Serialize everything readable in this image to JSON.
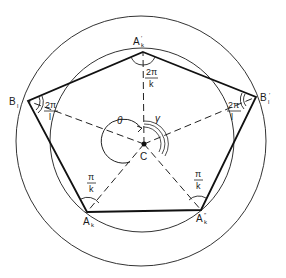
{
  "figure": {
    "circles": {
      "outer": {
        "cx": 141,
        "cy": 141,
        "r": 125
      },
      "inner": {
        "cx": 142,
        "cy": 140,
        "r": 92
      }
    },
    "center": {
      "label": "C",
      "x": 144,
      "y": 144
    },
    "vertices": [
      {
        "id": "A_k_prime",
        "label": "A",
        "sub": "k",
        "prime": "′",
        "x": 143,
        "y": 52
      },
      {
        "id": "B_l_prime",
        "label": "B",
        "sub": "l",
        "prime": "′",
        "x": 256,
        "y": 97
      },
      {
        "id": "A_k_dprime",
        "label": "A",
        "sub": "k",
        "prime": "″",
        "x": 201,
        "y": 210
      },
      {
        "id": "A_k",
        "label": "A",
        "sub": "k",
        "prime": "",
        "x": 87,
        "y": 212
      },
      {
        "id": "B_l",
        "label": "B",
        "sub": "l",
        "prime": "",
        "x": 28,
        "y": 101
      }
    ],
    "angle_labels": {
      "top": {
        "num": "2π",
        "den": "k"
      },
      "left": {
        "num": "2π",
        "den": "l"
      },
      "right": {
        "num": "2π",
        "den": "l"
      },
      "bottom_left": {
        "num": "π",
        "den": "k"
      },
      "bottom_right": {
        "num": "π",
        "den": "k"
      }
    },
    "greek": {
      "theta": "θ",
      "gamma": "γ"
    },
    "colors": {
      "line": "#1a1a1a",
      "background": "#ffffff"
    }
  }
}
